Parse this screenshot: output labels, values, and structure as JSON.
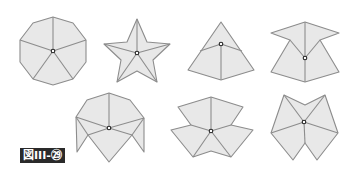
{
  "figure": {
    "label": "図III-㉙",
    "colors": {
      "fill": "#e8e8e8",
      "stroke": "#8c8c8c",
      "hub": "#222222",
      "label_bg": "#2a2a2a",
      "label_text": "#ffffff"
    },
    "shapes": [
      {
        "name": "decagon",
        "outline": "53,17 73,23 86,40 86,62 73,79 53,85 33,79 20,62 20,40 33,23",
        "creases": [
          "53,51 53,17",
          "53,51 20,40",
          "53,51 86,40",
          "53,51 33,79",
          "53,51 73,79"
        ],
        "hub": [
          53,
          51
        ]
      },
      {
        "name": "five-point-star",
        "outline": "137,19 147,42 170,44 153,60 157,82 137,71 117,82 121,60 104,44 127,42",
        "creases": [
          "137,53 137,19",
          "137,53 104,44",
          "137,53 170,44",
          "137,53 117,82",
          "137,53 157,82"
        ],
        "hub": [
          137,
          53
        ]
      },
      {
        "name": "triangular-pyramid",
        "outline": "221,22 254,70 221,80 188,70",
        "creases": [
          "221,44 221,80",
          "221,44 200,51",
          "221,44 242,51"
        ],
        "hub": [
          221,
          44
        ]
      },
      {
        "name": "tent-with-wings",
        "outline": "305,22 339,33 320,40 339,72 305,82 271,72 290,40 271,33",
        "creases": [
          "305,58 305,22",
          "305,58 290,40",
          "305,58 320,40",
          "305,58 305,82"
        ],
        "hub": [
          305,
          58
        ]
      },
      {
        "name": "dome-with-legs",
        "outline": "109,93 130,100 144,118 144,152 132,135 109,162 88,135 77,152 76,117 87,100",
        "creases": [
          "109,128 109,93",
          "109,128 76,117",
          "109,128 144,118",
          "109,128 88,135",
          "109,128 132,135",
          "88,135 76,117",
          "132,135 144,118"
        ],
        "hub": [
          109,
          128
        ]
      },
      {
        "name": "spread-fan",
        "outline": "211,97 243,107 231,125 253,130 231,157 211,151 193,157 171,130 191,125 178,107",
        "creases": [
          "211,131 211,97",
          "211,131 191,125",
          "211,131 231,125",
          "211,131 193,157",
          "211,131 231,157"
        ],
        "hub": [
          211,
          131
        ]
      },
      {
        "name": "inverted-star",
        "outline": "284,95 305,105 325,95 338,133 317,160 305,143 293,160 271,133",
        "creases": [
          "304,122 284,95",
          "304,122 325,95",
          "304,122 271,133",
          "304,122 338,133",
          "304,122 305,143"
        ],
        "hub": [
          304,
          122
        ]
      }
    ]
  }
}
